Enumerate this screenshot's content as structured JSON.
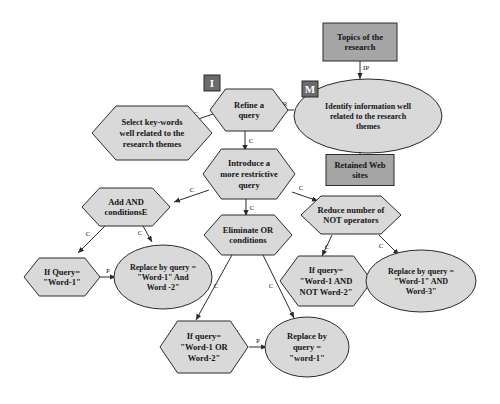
{
  "diagram": {
    "title_visible": false,
    "colors": {
      "node_fill_light": "#d9d9d9",
      "node_fill_box": "#a6a6a6",
      "badge_fill": "#6b6b6b",
      "stroke": "#2b2b2b",
      "background": "#ffffff",
      "text": "#141414"
    },
    "nodes": [
      {
        "id": "topics",
        "shape": "rect",
        "label": "Topics of the research",
        "lines": [
          "Topics of the",
          "research"
        ],
        "x": 360,
        "y": 42,
        "w": 74,
        "h": 38,
        "fill": "#a6a6a6",
        "font_size": 8.5
      },
      {
        "id": "identify",
        "shape": "ellipse",
        "label": "Identify information well related to the research themes",
        "lines": [
          "Identify information well",
          "related to the research",
          "themes"
        ],
        "x": 368,
        "y": 116,
        "rx": 74,
        "ry": 37,
        "fill": "#d9d9d9",
        "font_size": 8
      },
      {
        "id": "retained",
        "shape": "rect",
        "label": "Retained Web sites",
        "lines": [
          "Retained Web",
          "sites"
        ],
        "x": 360,
        "y": 170,
        "w": 68,
        "h": 31,
        "fill": "#a6a6a6",
        "font_size": 8.5
      },
      {
        "id": "refine",
        "shape": "hexagon",
        "label": "Refine a query",
        "lines": [
          "Refine a",
          "query"
        ],
        "x": 249,
        "y": 110,
        "w": 78,
        "h": 42,
        "fill": "#d9d9d9",
        "font_size": 8.5
      },
      {
        "id": "selectkw",
        "shape": "hexagon",
        "label": "Select key-words well related to the research themes",
        "lines": [
          "Select key-words",
          "well related to the",
          "research themes"
        ],
        "x": 152,
        "y": 133,
        "w": 120,
        "h": 54,
        "fill": "#d9d9d9",
        "font_size": 8.5
      },
      {
        "id": "introduce",
        "shape": "hexagon",
        "label": "Introduce a more restrictive query",
        "lines": [
          "Introduce a",
          "more restrictive",
          "query"
        ],
        "x": 249,
        "y": 174,
        "w": 92,
        "h": 50,
        "fill": "#d9d9d9",
        "font_size": 8.5
      },
      {
        "id": "addand",
        "shape": "hexagon",
        "label": "Add AND conditionsE",
        "lines": [
          "Add AND",
          "conditionsE"
        ],
        "x": 126,
        "y": 207,
        "w": 88,
        "h": 38,
        "fill": "#d9d9d9",
        "font_size": 8.5
      },
      {
        "id": "elimor",
        "shape": "hexagon",
        "label": "Eliminate OR conditions",
        "lines": [
          "Eliminate OR",
          "conditions"
        ],
        "x": 248,
        "y": 235,
        "w": 88,
        "h": 40,
        "fill": "#d9d9d9",
        "font_size": 8.5
      },
      {
        "id": "reducenot",
        "shape": "hexagon",
        "label": "Reduce number of NOT operators",
        "lines": [
          "Reduce number of",
          "NOT operators"
        ],
        "x": 351,
        "y": 215,
        "w": 100,
        "h": 38,
        "fill": "#d9d9d9",
        "font_size": 8.5
      },
      {
        "id": "ifword1",
        "shape": "hexagon",
        "label": "If Query= \"Word-1\"",
        "lines": [
          "If Query=",
          "\"Word-1\""
        ],
        "x": 62,
        "y": 277,
        "w": 76,
        "h": 38,
        "fill": "#d9d9d9",
        "font_size": 8.5
      },
      {
        "id": "replaceand2",
        "shape": "ellipse",
        "label": "Replace by query = \"Word-1\" And Word -2\"",
        "lines": [
          "Replace by query =",
          "\"Word-1\" And",
          "Word -2\""
        ],
        "x": 163,
        "y": 277,
        "rx": 49,
        "ry": 32,
        "fill": "#d9d9d9",
        "font_size": 8
      },
      {
        "id": "ifand1and2",
        "shape": "hexagon",
        "label": "If query= \"Word-1 AND NOT Word-2\"",
        "lines": [
          "If query=",
          "\"Word-1 AND",
          "NOT Word-2\""
        ],
        "x": 326,
        "y": 281,
        "w": 92,
        "h": 50,
        "fill": "#d9d9d9",
        "font_size": 8.5
      },
      {
        "id": "replaceand3",
        "shape": "ellipse",
        "label": "Replace by query = \"Word-1\" AND Word-3\"",
        "lines": [
          "Replace by query =",
          "\"Word-1\" AND",
          "Word-3\""
        ],
        "x": 421,
        "y": 281,
        "rx": 55,
        "ry": 31,
        "fill": "#d9d9d9",
        "font_size": 8
      },
      {
        "id": "iforword",
        "shape": "hexagon",
        "label": "If query= \"Word-1 OR Word-2\"",
        "lines": [
          "If query=",
          "\"Word-1 OR",
          "Word-2\""
        ],
        "x": 204,
        "y": 347,
        "w": 88,
        "h": 52,
        "fill": "#d9d9d9",
        "font_size": 8.5
      },
      {
        "id": "replaceword1",
        "shape": "ellipse",
        "label": "Replace by query = \"word-1\"",
        "lines": [
          "Replace by",
          "query =",
          "\"word-1\""
        ],
        "x": 307,
        "y": 347,
        "rx": 42,
        "ry": 30,
        "fill": "#d9d9d9",
        "font_size": 8.5
      }
    ],
    "badges": [
      {
        "id": "badge-i",
        "label": "I",
        "x": 212,
        "y": 83,
        "size": 16
      },
      {
        "id": "badge-m",
        "label": "M",
        "x": 310,
        "y": 89,
        "size": 16
      }
    ],
    "edges": [
      {
        "id": "topics-to-identify",
        "label": "IP",
        "from": "topics",
        "to": "identify",
        "path": "M 360 61 L 360 79",
        "label_x": 366,
        "label_y": 70
      },
      {
        "id": "identify-to-refine",
        "label": "R",
        "from": "identify",
        "to": "refine",
        "path": "M 294 110 L 272 110",
        "label_x": 285,
        "label_y": 106
      },
      {
        "id": "identify-to-retained",
        "label": "IP",
        "from": "identify",
        "to": "retained",
        "path": "M 360 152 L 360 165",
        "label_x": 366,
        "label_y": 160
      },
      {
        "id": "refine-to-selectkw",
        "label": "C",
        "from": "refine",
        "to": "selectkw",
        "path": "M 213 114 L 178 126",
        "label_x": 196,
        "label_y": 116
      },
      {
        "id": "refine-to-introduce",
        "label": "C",
        "from": "refine",
        "to": "introduce",
        "path": "M 245 131 L 245 151",
        "label_x": 251,
        "label_y": 143
      },
      {
        "id": "introduce-to-addand",
        "label": "C",
        "from": "introduce",
        "to": "addand",
        "path": "M 209 190 L 174 202",
        "label_x": 192,
        "label_y": 192
      },
      {
        "id": "introduce-to-elimor",
        "label": "C",
        "from": "introduce",
        "to": "elimor",
        "path": "M 246 199 L 246 216",
        "label_x": 252,
        "label_y": 210
      },
      {
        "id": "introduce-to-reducenot",
        "label": "C",
        "from": "introduce",
        "to": "reducenot",
        "path": "M 292 192 L 318 201",
        "label_x": 301,
        "label_y": 190
      },
      {
        "id": "addand-to-ifword1",
        "label": "C",
        "from": "addand",
        "to": "ifword1",
        "path": "M 105 226 L 78 253",
        "label_x": 88,
        "label_y": 236
      },
      {
        "id": "addand-to-replaceand2",
        "label": "C",
        "from": "addand",
        "to": "replaceand2",
        "path": "M 143 226 L 152 242",
        "label_x": 140,
        "label_y": 235
      },
      {
        "id": "ifword1-to-replaceand2",
        "label": "P",
        "from": "ifword1",
        "to": "replaceand2",
        "path": "M 100 277 L 116 277",
        "label_x": 108,
        "label_y": 273
      },
      {
        "id": "elimor-to-iforword",
        "label": "C",
        "from": "elimor",
        "to": "iforword",
        "path": "M 232 255 L 196 320",
        "label_x": 216,
        "label_y": 288
      },
      {
        "id": "elimor-to-replaceword1",
        "label": "C",
        "from": "elimor",
        "to": "replaceword1",
        "path": "M 263 255 L 294 318",
        "label_x": 271,
        "label_y": 288
      },
      {
        "id": "iforword-to-replaceword1",
        "label": "P",
        "from": "iforword",
        "to": "replaceword1",
        "path": "M 249 347 L 267 347",
        "label_x": 258,
        "label_y": 343
      },
      {
        "id": "reducenot-to-ifand1and2",
        "label": "C",
        "from": "reducenot",
        "to": "ifand1and2",
        "path": "M 332 235 L 322 256",
        "label_x": 327,
        "label_y": 249
      },
      {
        "id": "reducenot-to-replaceand3",
        "label": "C",
        "from": "reducenot",
        "to": "replaceand3",
        "path": "M 379 235 L 399 255",
        "label_x": 381,
        "label_y": 248
      },
      {
        "id": "ifand1and2-to-replaceand3",
        "label": "P",
        "from": "ifand1and2",
        "to": "replaceand3",
        "path": "M 373 281 L 388 281",
        "label_x": 380,
        "label_y": 277
      }
    ]
  }
}
